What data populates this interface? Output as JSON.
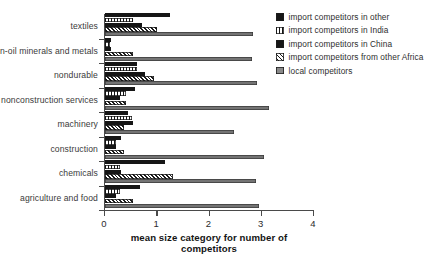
{
  "chart_data": {
    "type": "bar",
    "orientation": "horizontal",
    "title": "",
    "xlabel": "mean size category for number of competitors",
    "ylabel": "",
    "xlim": [
      0,
      4
    ],
    "xticks": [
      "0",
      "1",
      "2",
      "3",
      "4"
    ],
    "grid": false,
    "legend_position": "top-right",
    "categories": [
      "textiles",
      "non-oil minerals and metals",
      "nondurable",
      "nonconstruction services",
      "machinery",
      "construction",
      "chemicals",
      "agriculture and food"
    ],
    "series": [
      {
        "name": "import competitors in other",
        "swatch": "solid-black",
        "color": "#161616",
        "values": [
          1.25,
          0.12,
          0.62,
          0.58,
          0.45,
          0.32,
          1.15,
          0.68
        ]
      },
      {
        "name": "import competitors in India",
        "swatch": "vertical-stripes",
        "color": "#141414",
        "values": [
          0.55,
          0.1,
          0.62,
          0.42,
          0.52,
          0.22,
          0.3,
          0.3
        ]
      },
      {
        "name": "import competitors in China",
        "swatch": "solid-black",
        "color": "#161616",
        "values": [
          0.72,
          0.12,
          0.78,
          0.3,
          0.55,
          0.22,
          0.32,
          0.22
        ]
      },
      {
        "name": "import competitors from other Africa",
        "swatch": "diagonal-hatch",
        "color": "#191919",
        "values": [
          1.0,
          0.55,
          0.95,
          0.42,
          0.38,
          0.38,
          1.32,
          0.55
        ]
      },
      {
        "name": "local competitors",
        "swatch": "grey",
        "color": "#747474",
        "values": [
          2.85,
          2.82,
          2.92,
          3.15,
          2.48,
          3.05,
          2.9,
          2.95
        ]
      }
    ]
  }
}
